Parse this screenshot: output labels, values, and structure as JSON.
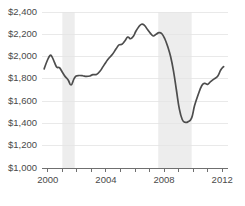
{
  "chart_data": {
    "type": "line",
    "title": "",
    "subtitle": "",
    "xlabel": "",
    "ylabel": "",
    "xlim": [
      1999.6,
      2012.4
    ],
    "ylim": [
      1000,
      2400
    ],
    "grid": true,
    "legend": null,
    "y_tick_labels": [
      "$2,400",
      "$2,200",
      "$2,000",
      "$1,800",
      "$1,600",
      "$1,400",
      "$1,200",
      "$1,000"
    ],
    "y_tick_values": [
      2400,
      2200,
      2000,
      1800,
      1600,
      1400,
      1200,
      1000
    ],
    "x_tick_labels": [
      "2000",
      "2004",
      "2008",
      "2012"
    ],
    "x_tick_values": [
      2000,
      2004,
      2008,
      2012
    ],
    "x_minor_ticks": [
      2000,
      2001,
      2002,
      2003,
      2004,
      2005,
      2006,
      2007,
      2008,
      2009,
      2010,
      2011,
      2012
    ],
    "value_prefix": "$",
    "line_color": "#4d4d4d",
    "grid_color": "#e3e3e3",
    "axis_color": "#6f6f6f",
    "band_color": "#ededed",
    "background_color": "#ffffff",
    "shaded_bands": [
      {
        "label": "recession",
        "start": 2001.0,
        "end": 2001.85
      },
      {
        "label": "recession",
        "start": 2007.6,
        "end": 2009.9
      }
    ],
    "series": [
      {
        "name": "value",
        "x": [
          1999.75,
          1999.95,
          2000.15,
          2000.3,
          2000.45,
          2000.62,
          2000.8,
          2001.0,
          2001.2,
          2001.4,
          2001.6,
          2001.8,
          2001.95,
          2002.15,
          2002.4,
          2002.65,
          2002.9,
          2003.1,
          2003.35,
          2003.6,
          2003.8,
          2004.0,
          2004.2,
          2004.45,
          2004.7,
          2004.9,
          2005.1,
          2005.3,
          2005.5,
          2005.7,
          2005.9,
          2006.05,
          2006.25,
          2006.45,
          2006.65,
          2006.85,
          2007.05,
          2007.25,
          2007.45,
          2007.65,
          2007.85,
          2008.05,
          2008.25,
          2008.45,
          2008.65,
          2008.85,
          2009.05,
          2009.25,
          2009.45,
          2009.65,
          2009.9,
          2010.1,
          2010.35,
          2010.6,
          2010.8,
          2011.0,
          2011.2,
          2011.45,
          2011.7,
          2011.9,
          2012.1
        ],
        "y": [
          1890,
          1960,
          2010,
          1995,
          1950,
          1905,
          1900,
          1860,
          1820,
          1790,
          1745,
          1800,
          1825,
          1830,
          1828,
          1822,
          1826,
          1838,
          1840,
          1870,
          1910,
          1950,
          1985,
          2020,
          2070,
          2105,
          2110,
          2140,
          2175,
          2160,
          2185,
          2225,
          2265,
          2290,
          2280,
          2245,
          2210,
          2185,
          2200,
          2215,
          2205,
          2160,
          2090,
          2000,
          1870,
          1700,
          1530,
          1435,
          1410,
          1415,
          1450,
          1560,
          1660,
          1740,
          1760,
          1750,
          1775,
          1800,
          1825,
          1880,
          1910
        ]
      }
    ]
  }
}
